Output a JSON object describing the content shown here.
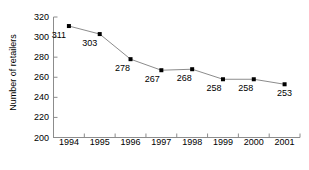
{
  "chart_data": {
    "type": "line",
    "title": "",
    "xlabel": "",
    "ylabel": "Number of retailers",
    "categories": [
      "1994",
      "1995",
      "1996",
      "1997",
      "1998",
      "1999",
      "2000",
      "2001"
    ],
    "values": [
      311,
      303,
      278,
      267,
      268,
      258,
      258,
      253
    ],
    "point_labels": [
      "311",
      "303",
      "278",
      "267",
      "268",
      "258",
      "258",
      "253"
    ],
    "ylim": [
      200,
      320
    ],
    "ytick_labels": [
      "200",
      "220",
      "240",
      "260",
      "280",
      "300",
      "320"
    ],
    "ytick_values": [
      200,
      220,
      240,
      260,
      280,
      300,
      320
    ],
    "grid": false,
    "legend": false,
    "legend_position": "none",
    "series": [
      {
        "name": "Number of retailers",
        "values": [
          311,
          303,
          278,
          267,
          268,
          258,
          258,
          253
        ],
        "line_color": "#8c8c8c",
        "marker_color": "#000000",
        "marker": "square"
      }
    ],
    "axis_color": "#8c8c8c",
    "text_color": "#000000",
    "background": "#ffffff"
  }
}
